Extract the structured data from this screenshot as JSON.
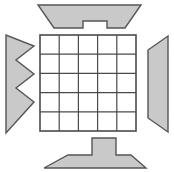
{
  "figure": {
    "canvas": {
      "width": 174,
      "height": 172,
      "background": "#ffffff"
    },
    "style": {
      "piece_fill": "#c9c9c9",
      "piece_stroke": "#555555",
      "piece_stroke_width": 1.4,
      "grid_fill": "#ffffff",
      "grid_stroke": "#4a4a4a",
      "grid_border_width": 1.6,
      "grid_inner_width": 1.2
    },
    "grid": {
      "label": "5 by 5 square grid",
      "x": 40,
      "y": 35,
      "width": 96,
      "height": 96,
      "columns": 5,
      "rows": 5,
      "cell_width": 19.2,
      "cell_height": 19.2
    },
    "pieces": [
      {
        "id": "top-piece",
        "label": "Top notched trapezoid",
        "points": "38,5 141,5 125,28 107,28 107,21 83,21 83,28 54,28"
      },
      {
        "id": "left-piece",
        "label": "Left zigzag arrow",
        "points": "6,35 6,133 34,102 16,88 34,74 16,60 34,46"
      },
      {
        "id": "right-piece",
        "label": "Right quadrilateral",
        "points": "168,36 168,132 148,118 148,50"
      },
      {
        "id": "bottom-piece",
        "label": "Bottom stepped trapezoid",
        "points": "92,138 116,138 116,155 131,155 146,168 44,168 68,155 92,155"
      }
    ]
  }
}
